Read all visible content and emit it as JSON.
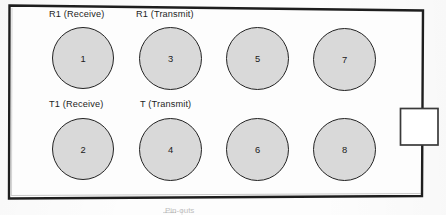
{
  "figure": {
    "kind": "connector-pinout-diagram",
    "frame": {
      "shape": "rectangle",
      "skewed": true,
      "border_color": "#1e1e1e",
      "fill_color": "#fdfdfd"
    },
    "side_tab": {
      "name": "latch-tab",
      "position": "right",
      "fill_color": "#ffffff",
      "border_color": "#3a3a3a"
    },
    "terminal_style": {
      "fill_color": "#d9d9d9",
      "border_color": "#232323",
      "diameter_px": 63
    },
    "labels": [
      {
        "text": "R1 (Receive)",
        "pin": "1"
      },
      {
        "text": "R1 (Transmit)",
        "pin": "3"
      },
      {
        "text": "T1 (Receive)",
        "pin": "2"
      },
      {
        "text": "T (Transmit)",
        "pin": "4"
      }
    ],
    "terminals": [
      {
        "number": "1",
        "row": "top",
        "column": 1
      },
      {
        "number": "3",
        "row": "top",
        "column": 2
      },
      {
        "number": "5",
        "row": "top",
        "column": 3
      },
      {
        "number": "7",
        "row": "top",
        "column": 4
      },
      {
        "number": "2",
        "row": "bottom",
        "column": 1
      },
      {
        "number": "4",
        "row": "bottom",
        "column": 2
      },
      {
        "number": "6",
        "row": "bottom",
        "column": 3
      },
      {
        "number": "8",
        "row": "bottom",
        "column": 4
      }
    ],
    "caption_fragment": "Pin-outs"
  }
}
